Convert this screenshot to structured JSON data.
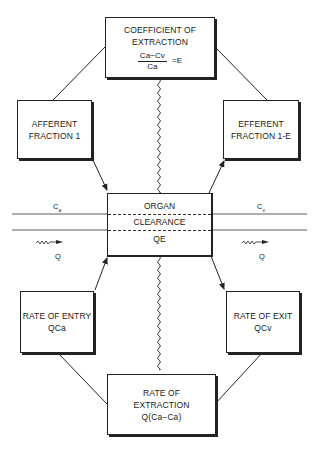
{
  "diagram": {
    "top_box": {
      "title_line1": "COEFFICIENT OF",
      "title_line2": "EXTRACTION",
      "numerator": "Ca−Cv",
      "denominator": "Ca",
      "result": "=E"
    },
    "afferent_box": {
      "line1": "AFFERENT",
      "line2": "FRACTION 1"
    },
    "efferent_box": {
      "line1": "EFFERENT",
      "line2": "FRACTION 1-E"
    },
    "organ_box": {
      "row1": "ORGAN",
      "row2": "CLEARANCE",
      "row3": "QE"
    },
    "entry_box": {
      "line1": "RATE OF ENTRY",
      "line2": "QCa"
    },
    "exit_box": {
      "line1": "RATE OF EXIT",
      "line2": "QCv"
    },
    "bottom_box": {
      "line1": "RATE OF",
      "line2": "EXTRACTION",
      "line3": "Q(Ca−Ca)"
    },
    "left_vessel": {
      "conc_label": "C",
      "conc_sub": "a",
      "flow_label": "Q"
    },
    "right_vessel": {
      "conc_label": "C",
      "conc_sub": "v",
      "flow_label": "Q"
    },
    "colors": {
      "ink": "#222222",
      "background": "#ffffff"
    }
  }
}
